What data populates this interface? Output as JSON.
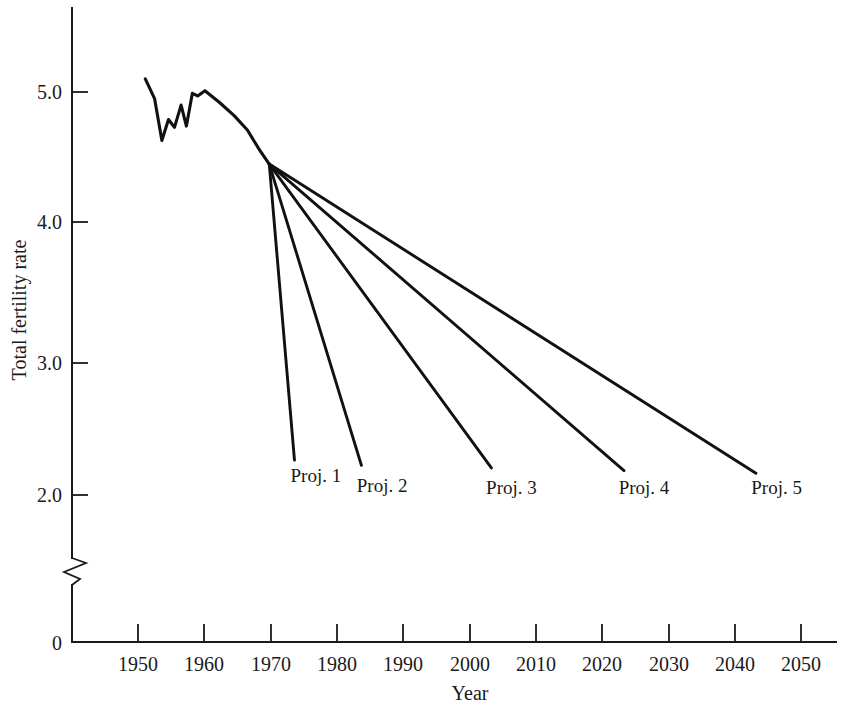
{
  "chart_data": {
    "type": "line",
    "title": "",
    "xlabel": "Year",
    "ylabel": "Total fertility rate",
    "xlim": [
      1943,
      2057
    ],
    "ylim": [
      0,
      5.55
    ],
    "y_axis_break": true,
    "y_axis_break_between": [
      0.0,
      1.6
    ],
    "grid": false,
    "legend": "none",
    "legend_position": "inline-end-labels",
    "xticks": [
      1950,
      1960,
      1970,
      1980,
      1990,
      2000,
      2010,
      2020,
      2030,
      2040,
      2050
    ],
    "xtick_labels": [
      "1950",
      "1960",
      "1970",
      "1980",
      "1990",
      "2000",
      "2010",
      "2020",
      "2030",
      "2040",
      "2050"
    ],
    "yticks": [
      0,
      2.0,
      3.0,
      4.0,
      5.0
    ],
    "ytick_labels": [
      "0",
      "2.0",
      "3.0",
      "4.0",
      "5.0"
    ],
    "series": [
      {
        "name": "Historical",
        "label": "",
        "color": "#111111",
        "x": [
          1951.1,
          1952.5,
          1953.6,
          1954.6,
          1955.5,
          1956.5,
          1957.3,
          1958.2,
          1959.0,
          1960.1,
          1962.3,
          1964.5,
          1966.5,
          1968.3,
          1969.8
        ],
        "y": [
          5.1,
          4.95,
          4.63,
          4.79,
          4.73,
          4.9,
          4.74,
          4.99,
          4.97,
          5.01,
          4.92,
          4.82,
          4.71,
          4.56,
          4.45
        ]
      },
      {
        "name": "Proj. 1",
        "label": "Proj. 1",
        "color": "#111111",
        "x": [
          1969.8,
          1973.6
        ],
        "y": [
          4.45,
          2.19
        ]
      },
      {
        "name": "Proj. 2",
        "label": "Proj. 2",
        "color": "#111111",
        "x": [
          1969.8,
          1983.7
        ],
        "y": [
          4.45,
          2.15
        ]
      },
      {
        "name": "Proj. 3",
        "label": "Proj. 3",
        "color": "#111111",
        "x": [
          1969.8,
          2003.3
        ],
        "y": [
          4.45,
          2.13
        ]
      },
      {
        "name": "Proj. 4",
        "label": "Proj. 4",
        "color": "#111111",
        "x": [
          1969.8,
          2023.3
        ],
        "y": [
          4.45,
          2.11
        ]
      },
      {
        "name": "Proj. 5",
        "label": "Proj. 5",
        "color": "#111111",
        "x": [
          1969.8,
          2043.2
        ],
        "y": [
          4.45,
          2.09
        ]
      }
    ],
    "annotations": [
      {
        "text": "Proj. 1",
        "x": 1973.0,
        "y": 2.02
      },
      {
        "text": "Proj. 2",
        "x": 1983.0,
        "y": 1.95
      },
      {
        "text": "Proj. 3",
        "x": 2002.5,
        "y": 1.93
      },
      {
        "text": "Proj. 4",
        "x": 2022.5,
        "y": 1.93
      },
      {
        "text": "Proj. 5",
        "x": 2042.5,
        "y": 1.93
      }
    ]
  }
}
